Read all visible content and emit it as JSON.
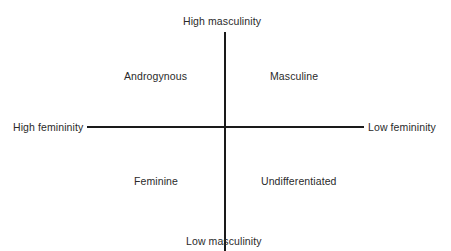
{
  "diagram": {
    "type": "quadrant",
    "axes": {
      "vertical": {
        "top_label": "High masculinity",
        "bottom_label": "Low masculinity"
      },
      "horizontal": {
        "left_label": "High femininity",
        "right_label": "Low femininity"
      }
    },
    "quadrants": {
      "top_left": "Androgynous",
      "top_right": "Masculine",
      "bottom_left": "Feminine",
      "bottom_right": "Undifferentiated"
    },
    "colors": {
      "line": "#1a1a1a",
      "text": "#2a2a2a",
      "background": "#ffffff"
    }
  }
}
